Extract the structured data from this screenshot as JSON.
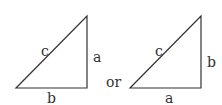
{
  "diagram": {
    "triangles": [
      {
        "hypotenuse": "c",
        "vertical_side": "a",
        "horizontal_side": "b"
      },
      {
        "hypotenuse": "c",
        "vertical_side": "b",
        "horizontal_side": "a"
      }
    ],
    "connector": "or",
    "colors": {
      "stroke": "#333333",
      "background": "#ffffff"
    }
  }
}
